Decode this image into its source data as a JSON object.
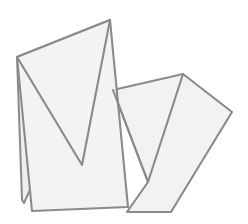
{
  "figure": {
    "canvas": {
      "width": 248,
      "height": 224
    },
    "background_color": "#ffffff",
    "style": {
      "fill_color": "#f2f2f0",
      "stroke_color": "#8a8a8a",
      "stroke_color_dark": "#7c7c7c",
      "stroke_width": 2.1,
      "stroke_width_thin": 1.7
    },
    "shapes": [
      {
        "name": "back-sheet",
        "label": "Back sheet",
        "fill": "#efefed",
        "stroke": "#8a8a8a",
        "stroke_width": 2.0,
        "points": "17,57 110,20 105,24 24,203 22,200"
      },
      {
        "name": "right-sheet",
        "label": "Right folded sheet",
        "fill": "#f2f2f0",
        "stroke": "#8a8a8a",
        "stroke_width": 2.1,
        "points": "113,90 183,74 232,112 171,212 127,212 148,182"
      },
      {
        "name": "front-sheet",
        "label": "Front folded sheet",
        "fill": "#f3f3f1",
        "stroke": "#8a8a8a",
        "stroke_width": 2.1,
        "points": "17,57 110,20 128,207 32,211"
      },
      {
        "name": "zigzag-fold",
        "label": "Zigzag fold crease",
        "fill": "none",
        "stroke": "#8a8a8a",
        "stroke_width": 2.1,
        "points": "17,57 82,165 110,20"
      },
      {
        "name": "right-sheet-crease",
        "label": "Right sheet fold crease",
        "fill": "none",
        "stroke": "#8a8a8a",
        "stroke_width": 2.1,
        "points": "113,90 148,182 183,74"
      }
    ],
    "vertices": [
      {
        "name": "apex-top",
        "x": 110,
        "y": 20
      },
      {
        "name": "corner-left",
        "x": 17,
        "y": 57
      },
      {
        "name": "notch-left-bottom",
        "x": 82,
        "y": 165
      },
      {
        "name": "corner-back-bottom-left",
        "x": 24,
        "y": 203
      },
      {
        "name": "corner-front-bottom-left",
        "x": 32,
        "y": 211
      },
      {
        "name": "corner-front-bottom-right",
        "x": 128,
        "y": 207
      },
      {
        "name": "right-sheet-top-left",
        "x": 113,
        "y": 90
      },
      {
        "name": "right-sheet-top-right",
        "x": 183,
        "y": 74
      },
      {
        "name": "right-sheet-far-right",
        "x": 232,
        "y": 112
      },
      {
        "name": "notch-right-bottom",
        "x": 148,
        "y": 182
      },
      {
        "name": "right-sheet-bottom-left",
        "x": 127,
        "y": 212
      },
      {
        "name": "right-sheet-bottom-right",
        "x": 171,
        "y": 212
      }
    ]
  }
}
